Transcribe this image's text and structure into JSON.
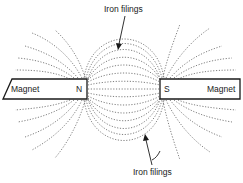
{
  "diagram": {
    "labels": {
      "top_callout": "Iron filings",
      "bottom_callout": "Iron filings",
      "left_magnet": "Magnet",
      "left_pole": "N",
      "right_pole": "S",
      "right_magnet": "Magnet"
    },
    "colors": {
      "ink": "#1a1a1a",
      "background": "#ffffff"
    }
  }
}
